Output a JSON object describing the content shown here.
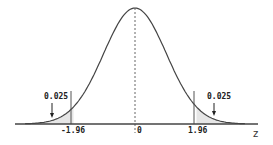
{
  "chart_data": {
    "type": "area",
    "xlabel": "z",
    "ylabel": "",
    "x_ticks": [
      "-1.96",
      "0",
      "1.96"
    ],
    "critical_values": [
      -1.96,
      1.96
    ],
    "tail_areas": [
      {
        "label": "0.025",
        "region": "z < -1.96",
        "value": 0.025
      },
      {
        "label": "0.025",
        "region": "z > 1.96",
        "value": 0.025
      }
    ],
    "mean": 0,
    "xlim": [
      -3.5,
      3.5
    ],
    "grid": false,
    "legend": "none",
    "annotations": [
      "0.025",
      "0.025",
      "dashed line at z=0"
    ]
  },
  "labels": {
    "left_area": "0.025",
    "right_area": "0.025",
    "tick_left": "-1.96",
    "tick_center": "0",
    "tick_right": "1.96",
    "axis_label": "z"
  }
}
